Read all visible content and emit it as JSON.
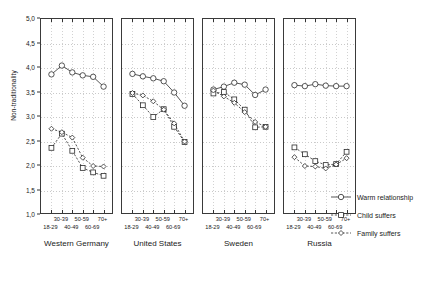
{
  "chart_data": {
    "type": "line",
    "title": "",
    "xlabel": "",
    "ylabel": "Non-traditionality",
    "ylim": [
      1.0,
      5.0
    ],
    "yticks": [
      "1,0",
      "1,5",
      "2,0",
      "2,5",
      "3,0",
      "3,5",
      "4,0",
      "4,5",
      "5,0"
    ],
    "ytick_values": [
      1.0,
      1.5,
      2.0,
      2.5,
      3.0,
      3.5,
      4.0,
      4.5,
      5.0
    ],
    "grid": true,
    "legend_position": "right",
    "categories": [
      "18-29",
      "30-39",
      "40-49",
      "50-59",
      "60-69",
      "70+"
    ],
    "legend": [
      "Warm relationship",
      "Child suffers",
      "Family suffers"
    ],
    "panels": [
      {
        "name": "Western Germany",
        "series": [
          {
            "name": "Warm relationship",
            "marker": "circle",
            "values": [
              3.87,
              4.05,
              3.91,
              3.85,
              3.82,
              3.62
            ]
          },
          {
            "name": "Child suffers",
            "marker": "square",
            "values": [
              2.37,
              2.66,
              2.31,
              1.96,
              1.87,
              1.8
            ]
          },
          {
            "name": "Family suffers",
            "marker": "diamond",
            "values": [
              2.76,
              2.69,
              2.58,
              2.17,
              2.0,
              1.99
            ]
          }
        ]
      },
      {
        "name": "United States",
        "series": [
          {
            "name": "Warm relationship",
            "marker": "circle",
            "values": [
              3.88,
              3.83,
              3.79,
              3.73,
              3.5,
              3.23
            ]
          },
          {
            "name": "Child suffers",
            "marker": "square",
            "values": [
              3.47,
              3.24,
              3.0,
              3.16,
              2.8,
              2.49
            ]
          },
          {
            "name": "Family suffers",
            "marker": "diamond",
            "values": [
              3.49,
              3.44,
              3.32,
              3.15,
              2.87,
              2.5
            ]
          }
        ]
      },
      {
        "name": "Sweden",
        "series": [
          {
            "name": "Warm relationship",
            "marker": "circle",
            "values": [
              3.56,
              3.62,
              3.7,
              3.66,
              3.45,
              3.56
            ]
          },
          {
            "name": "Child suffers",
            "marker": "square",
            "values": [
              3.48,
              3.51,
              3.36,
              3.15,
              2.79,
              2.8
            ]
          },
          {
            "name": "Family suffers",
            "marker": "diamond",
            "values": [
              3.54,
              3.42,
              3.29,
              3.1,
              2.9,
              2.8
            ]
          }
        ]
      },
      {
        "name": "Russia",
        "series": [
          {
            "name": "Warm relationship",
            "marker": "circle",
            "values": [
              3.65,
              3.63,
              3.67,
              3.64,
              3.63,
              3.63
            ]
          },
          {
            "name": "Child suffers",
            "marker": "square",
            "values": [
              2.38,
              2.24,
              2.1,
              2.02,
              2.04,
              2.29
            ]
          },
          {
            "name": "Family suffers",
            "marker": "diamond",
            "values": [
              2.18,
              2.0,
              1.99,
              1.95,
              2.03,
              2.16
            ]
          }
        ]
      }
    ]
  }
}
